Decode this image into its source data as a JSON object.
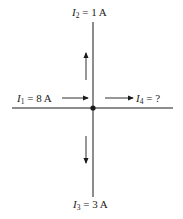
{
  "diagram": {
    "type": "kirchhoff-current-junction",
    "junction": {
      "x": 93,
      "y": 108
    },
    "currents": [
      {
        "id": "I1",
        "symbol": "I",
        "subscript": "1",
        "value": "= 8 A",
        "direction": "into junction (rightward)"
      },
      {
        "id": "I2",
        "symbol": "I",
        "subscript": "2",
        "value": "= 1 A",
        "direction": "out of junction (upward)"
      },
      {
        "id": "I3",
        "symbol": "I",
        "subscript": "3",
        "value": "= 3 A",
        "direction": "out of junction (downward)"
      },
      {
        "id": "I4",
        "symbol": "I",
        "subscript": "4",
        "value": "= ?",
        "direction": "out of junction (rightward)"
      }
    ],
    "colors": {
      "wire": "#1a1a1a",
      "background": "#ffffff"
    }
  }
}
